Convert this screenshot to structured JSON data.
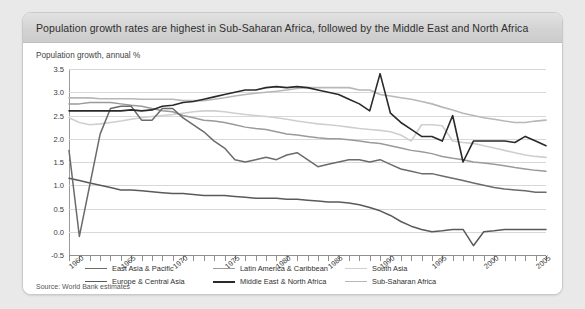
{
  "card": {
    "title": "Population growth rates are highest in Sub-Saharan Africa, followed by the Middle East and North Africa",
    "subtitle": "Population growth, annual %",
    "source": "Source: World Bank estimates"
  },
  "chart_data": {
    "type": "line",
    "title": "Population growth rates are highest in Sub-Saharan Africa, followed by the Middle East and North Africa",
    "subtitle": "Population growth, annual %",
    "xlabel": "",
    "ylabel": "Population growth, annual %",
    "ylim": [
      -0.5,
      3.5
    ],
    "xlim": [
      1960,
      2006
    ],
    "ytick_labels": [
      "3.5",
      "3.0",
      "2.5",
      "2.0",
      "1.5",
      "1.0",
      "0.5",
      "0.0",
      "-0.5"
    ],
    "yticks": [
      3.5,
      3.0,
      2.5,
      2.0,
      1.5,
      1.0,
      0.5,
      0.0,
      -0.5
    ],
    "xtick_labels": [
      "1960",
      "1965",
      "1970",
      "1975",
      "1980",
      "1985",
      "1990",
      "1995",
      "2000",
      "2005"
    ],
    "xticks": [
      1960,
      1965,
      1970,
      1975,
      1980,
      1985,
      1990,
      1995,
      2000,
      2005
    ],
    "xtick_step": 1,
    "grid": true,
    "legend_position": "bottom-left",
    "x": [
      1960,
      1961,
      1962,
      1963,
      1964,
      1965,
      1966,
      1967,
      1968,
      1969,
      1970,
      1971,
      1972,
      1973,
      1974,
      1975,
      1976,
      1977,
      1978,
      1979,
      1980,
      1981,
      1982,
      1983,
      1984,
      1985,
      1986,
      1987,
      1988,
      1989,
      1990,
      1991,
      1992,
      1993,
      1994,
      1995,
      1996,
      1997,
      1998,
      1999,
      2000,
      2001,
      2002,
      2003,
      2004,
      2005,
      2006
    ],
    "series": [
      {
        "name": "East Asia & Pacific",
        "color": "#6b6b6b",
        "width": 1.5,
        "values": [
          1.75,
          -0.1,
          1.0,
          2.1,
          2.65,
          2.7,
          2.7,
          2.4,
          2.4,
          2.65,
          2.65,
          2.45,
          2.3,
          2.15,
          1.95,
          1.8,
          1.55,
          1.5,
          1.55,
          1.6,
          1.55,
          1.65,
          1.7,
          1.55,
          1.4,
          1.45,
          1.5,
          1.55,
          1.55,
          1.5,
          1.55,
          1.45,
          1.35,
          1.3,
          1.25,
          1.25,
          1.2,
          1.15,
          1.1,
          1.05,
          1.0,
          0.95,
          0.92,
          0.9,
          0.88,
          0.85,
          0.85
        ]
      },
      {
        "name": "Europe & Central Asia",
        "color": "#5a5a5a",
        "width": 1.5,
        "values": [
          1.15,
          1.1,
          1.05,
          1.0,
          0.95,
          0.9,
          0.9,
          0.88,
          0.86,
          0.84,
          0.82,
          0.82,
          0.8,
          0.78,
          0.78,
          0.78,
          0.76,
          0.74,
          0.72,
          0.72,
          0.72,
          0.7,
          0.7,
          0.68,
          0.66,
          0.64,
          0.64,
          0.62,
          0.58,
          0.52,
          0.45,
          0.35,
          0.22,
          0.12,
          0.05,
          0.0,
          0.02,
          0.05,
          0.05,
          -0.3,
          0.0,
          0.02,
          0.05,
          0.05,
          0.05,
          0.05,
          0.05
        ]
      },
      {
        "name": "Latin America & Caribbean",
        "color": "#9a9a9a",
        "width": 1.5,
        "values": [
          2.75,
          2.75,
          2.78,
          2.78,
          2.78,
          2.75,
          2.72,
          2.7,
          2.65,
          2.6,
          2.58,
          2.5,
          2.45,
          2.4,
          2.38,
          2.35,
          2.3,
          2.25,
          2.22,
          2.2,
          2.15,
          2.1,
          2.08,
          2.05,
          2.02,
          2.0,
          2.0,
          1.98,
          1.95,
          1.92,
          1.9,
          1.85,
          1.8,
          1.75,
          1.72,
          1.68,
          1.62,
          1.58,
          1.55,
          1.5,
          1.48,
          1.45,
          1.42,
          1.38,
          1.35,
          1.32,
          1.3
        ]
      },
      {
        "name": "Middle East & North Africa",
        "color": "#2a2a2a",
        "width": 1.6,
        "values": [
          2.6,
          2.6,
          2.6,
          2.6,
          2.6,
          2.6,
          2.62,
          2.6,
          2.62,
          2.7,
          2.72,
          2.78,
          2.8,
          2.85,
          2.9,
          2.95,
          3.0,
          3.05,
          3.05,
          3.1,
          3.12,
          3.1,
          3.12,
          3.1,
          3.05,
          3.0,
          2.95,
          2.85,
          2.75,
          2.6,
          3.4,
          2.55,
          2.35,
          2.2,
          2.05,
          2.05,
          1.95,
          2.5,
          1.5,
          1.95,
          1.95,
          1.95,
          1.95,
          1.92,
          2.05,
          1.95,
          1.85
        ]
      },
      {
        "name": "South Asia",
        "color": "#cfcfcf",
        "width": 1.6,
        "values": [
          2.45,
          2.35,
          2.3,
          2.32,
          2.35,
          2.38,
          2.42,
          2.45,
          2.48,
          2.5,
          2.52,
          2.55,
          2.58,
          2.6,
          2.6,
          2.58,
          2.55,
          2.52,
          2.5,
          2.48,
          2.45,
          2.42,
          2.38,
          2.35,
          2.32,
          2.3,
          2.28,
          2.25,
          2.22,
          2.2,
          2.18,
          2.15,
          2.08,
          1.95,
          2.3,
          2.3,
          2.28,
          1.95,
          1.92,
          1.9,
          1.85,
          1.8,
          1.75,
          1.7,
          1.65,
          1.62,
          1.6
        ]
      },
      {
        "name": "Sub-Saharan Africa",
        "color": "#b8b8b8",
        "width": 1.6,
        "values": [
          2.88,
          2.88,
          2.88,
          2.86,
          2.86,
          2.86,
          2.86,
          2.85,
          2.85,
          2.85,
          2.85,
          2.82,
          2.82,
          2.82,
          2.85,
          2.88,
          2.92,
          2.95,
          2.98,
          3.0,
          3.02,
          3.05,
          3.08,
          3.1,
          3.1,
          3.1,
          3.1,
          3.1,
          3.05,
          3.05,
          2.95,
          2.92,
          2.88,
          2.85,
          2.8,
          2.75,
          2.68,
          2.62,
          2.55,
          2.5,
          2.45,
          2.42,
          2.38,
          2.35,
          2.35,
          2.38,
          2.4
        ]
      }
    ]
  },
  "legend": {
    "items": [
      {
        "label": "East Asia & Pacific",
        "color": "#6b6b6b",
        "width": 1.6
      },
      {
        "label": "Latin America & Caribbean",
        "color": "#9a9a9a",
        "width": 1.6
      },
      {
        "label": "South Asia",
        "color": "#cfcfcf",
        "width": 1.8
      },
      {
        "label": "Europe & Central Asia",
        "color": "#5a5a5a",
        "width": 1.6
      },
      {
        "label": "Middle East & North Africa",
        "color": "#2a2a2a",
        "width": 2.0
      },
      {
        "label": "Sub-Saharan Africa",
        "color": "#b8b8b8",
        "width": 1.8
      }
    ]
  }
}
